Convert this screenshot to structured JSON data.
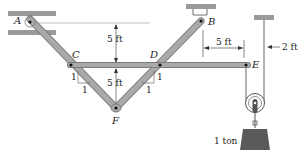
{
  "diagram": {
    "type": "frame-truss-with-pulley",
    "colors": {
      "member": "#a9a9a9",
      "member_edge": "#6e6e6e",
      "support": "#9a9a9a",
      "weight": "#5a5a5a",
      "text": "#222222"
    },
    "nodes": {
      "A": "A",
      "B": "B",
      "C": "C",
      "D": "D",
      "E": "E",
      "F": "F"
    },
    "dimensions": {
      "a_to_cd_vertical": "5 ft",
      "cd_to_f_vertical": "5 ft",
      "b_to_e_horizontal": "5 ft",
      "rope_offset": "2 ft"
    },
    "slopes": {
      "left_rise": "1",
      "left_run": "1",
      "right_rise": "1",
      "right_run": "1"
    },
    "load": {
      "label": "1 ton"
    }
  }
}
